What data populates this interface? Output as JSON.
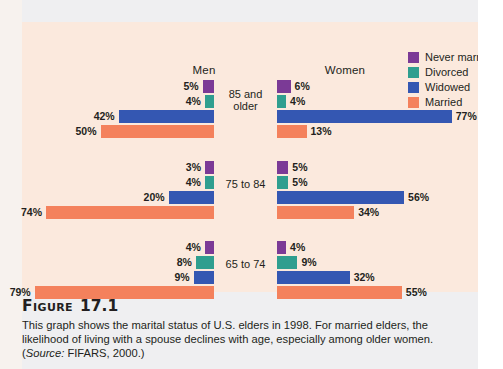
{
  "figure": {
    "title_word": "Figure",
    "title_number": "17.1",
    "caption": "This graph shows the marital status of U.S. elders in 1998. For married elders, the likelihood of living with a spouse declines with age, especially among older women.",
    "source_prefix": "Source:",
    "source_text": "FIFARS, 2000.)",
    "source_open": "("
  },
  "colors": {
    "panel_background": "#fbe9dd",
    "page_background": "#efeff1",
    "never_married": "#7b3a96",
    "divorced": "#2f9e8f",
    "widowed": "#3457b2",
    "married": "#f4815c",
    "text": "#231f20"
  },
  "headers": {
    "men": "Men",
    "women": "Women"
  },
  "legend": {
    "items": [
      {
        "label": "Never married",
        "color": "#7b3a96",
        "key": "never_married"
      },
      {
        "label": "Divorced",
        "color": "#2f9e8f",
        "key": "divorced"
      },
      {
        "label": "Widowed",
        "color": "#3457b2",
        "key": "widowed"
      },
      {
        "label": "Married",
        "color": "#f4815c",
        "key": "married"
      }
    ]
  },
  "chart_data": {
    "type": "bar",
    "title": "Marital status of U.S. elders in 1998",
    "orientation": "horizontal-diverging",
    "xlabel": "",
    "ylabel": "",
    "units": "percent",
    "grid": false,
    "legend_position": "top-right",
    "categories": [
      "85 and older",
      "75 to 84",
      "65 to 74"
    ],
    "series": [
      {
        "name": "Never married",
        "color": "#7b3a96",
        "men": [
          5,
          3,
          4
        ],
        "women": [
          6,
          5,
          4
        ]
      },
      {
        "name": "Divorced",
        "color": "#2f9e8f",
        "men": [
          4,
          4,
          8
        ],
        "women": [
          4,
          5,
          9
        ]
      },
      {
        "name": "Widowed",
        "color": "#3457b2",
        "men": [
          42,
          20,
          9
        ],
        "women": [
          77,
          56,
          32
        ]
      },
      {
        "name": "Married",
        "color": "#f4815c",
        "men": [
          50,
          74,
          79
        ],
        "women": [
          13,
          34,
          55
        ]
      }
    ],
    "groups": [
      {
        "age": "85 and older",
        "age_line1": "85 and",
        "age_line2": "older",
        "men": [
          {
            "label": "5%",
            "value": 5
          },
          {
            "label": "4%",
            "value": 4
          },
          {
            "label": "42%",
            "value": 42
          },
          {
            "label": "50%",
            "value": 50
          }
        ],
        "women": [
          {
            "label": "6%",
            "value": 6
          },
          {
            "label": "4%",
            "value": 4
          },
          {
            "label": "77%",
            "value": 77
          },
          {
            "label": "13%",
            "value": 13
          }
        ]
      },
      {
        "age": "75 to 84",
        "age_line1": "75 to 84",
        "age_line2": "",
        "men": [
          {
            "label": "3%",
            "value": 3
          },
          {
            "label": "4%",
            "value": 4
          },
          {
            "label": "20%",
            "value": 20
          },
          {
            "label": "74%",
            "value": 74
          }
        ],
        "women": [
          {
            "label": "5%",
            "value": 5
          },
          {
            "label": "5%",
            "value": 5
          },
          {
            "label": "56%",
            "value": 56
          },
          {
            "label": "34%",
            "value": 34
          }
        ]
      },
      {
        "age": "65 to 74",
        "age_line1": "65 to 74",
        "age_line2": "",
        "men": [
          {
            "label": "4%",
            "value": 4
          },
          {
            "label": "8%",
            "value": 8
          },
          {
            "label": "9%",
            "value": 9
          },
          {
            "label": "79%",
            "value": 79
          }
        ],
        "women": [
          {
            "label": "4%",
            "value": 4
          },
          {
            "label": "9%",
            "value": 9
          },
          {
            "label": "32%",
            "value": 32
          },
          {
            "label": "55%",
            "value": 55
          }
        ]
      }
    ]
  }
}
